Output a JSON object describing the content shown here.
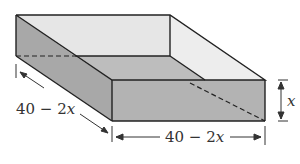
{
  "figure": {
    "labels": {
      "depth_label": "40 − 2",
      "depth_var": "x",
      "width_label": "40 − 2",
      "width_var": "x",
      "height_var": "x"
    },
    "colors": {
      "back_wall": "#e6e6e6",
      "right_wall": "#ededed",
      "floor": "#bdbdbd",
      "left_wall": "#a8a8a8",
      "front_face": "#b3b3b3",
      "stroke": "#222222"
    }
  }
}
